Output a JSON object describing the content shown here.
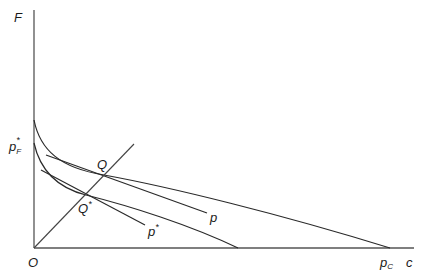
{
  "diagram": {
    "axes": {
      "y_label": "F",
      "x_label": "c",
      "origin_label": "O"
    },
    "labels": {
      "pF_star": {
        "base": "p",
        "sub": "F",
        "sup": "*"
      },
      "pC": {
        "base": "p",
        "sub": "C"
      },
      "Q": "Q",
      "Q_star": {
        "base": "Q",
        "sup": "*"
      },
      "p": "p",
      "p_star": {
        "base": "p",
        "sup": "*"
      }
    },
    "elements": [
      "upper convex curve from y-axis to p_C on x-axis",
      "lower convex curve from y-axis to x-axis",
      "tangent line p touching upper curve at Q",
      "tangent line p* touching lower curve at Q*",
      "ray from origin O through Q* and Q"
    ],
    "colors": {
      "stroke": "#2a2a2a",
      "background": "#ffffff"
    }
  }
}
